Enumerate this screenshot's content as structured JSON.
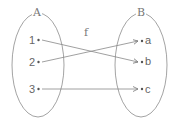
{
  "diagram": {
    "type": "function-mapping",
    "function_label": "f",
    "sets": [
      {
        "name": "A",
        "elements": [
          "1",
          "2",
          "3"
        ]
      },
      {
        "name": "B",
        "elements": [
          "a",
          "b",
          "c"
        ]
      }
    ],
    "mappings": [
      {
        "from": "1",
        "to": "b"
      },
      {
        "from": "2",
        "to": "a"
      },
      {
        "from": "3",
        "to": "c"
      }
    ],
    "colors": {
      "stroke": "#888888",
      "text": "#666666",
      "background": "#ffffff"
    }
  }
}
